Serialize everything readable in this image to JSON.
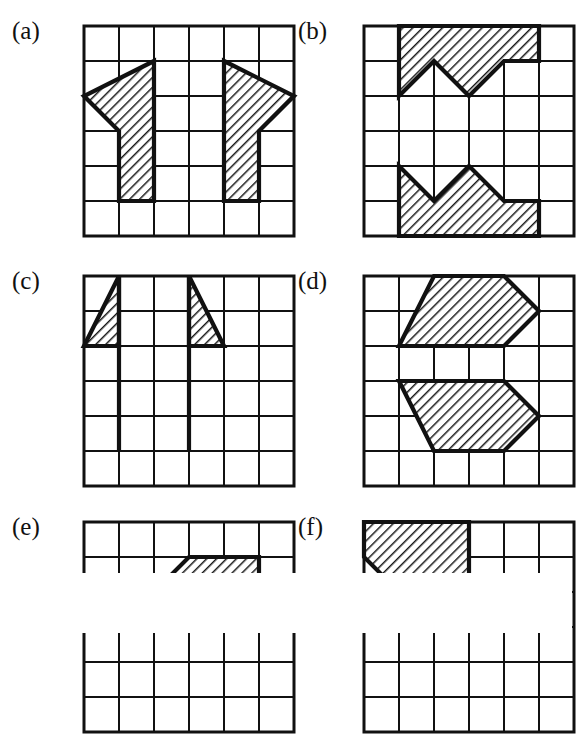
{
  "figure": {
    "kind": "grid-puzzle-figure",
    "panel_count": 6,
    "grid": {
      "cols": 6,
      "rows": 6,
      "cell_px": 35
    },
    "style": {
      "ink": "#111111",
      "paper": "#ffffff",
      "hatch_color": "#1a1a1a",
      "thin_line_px": 2,
      "thick_line_px": 4.2
    }
  },
  "panels": [
    {
      "id": "a",
      "label": "(a)",
      "label_x": 12,
      "label_y": 18,
      "grid_x": 80,
      "grid_y": 22,
      "shapes": [
        {
          "name": "left-arrow-up",
          "points": "2,1 0,2 1,3 1,5 2,5 2,3 2,1",
          "filled": true
        },
        {
          "name": "right-arrow-up",
          "points": "4,1 6,2 5,3 5,5 4,5 4,3 4,1",
          "filled": true
        }
      ]
    },
    {
      "id": "b",
      "label": "(b)",
      "label_x": 298,
      "label_y": 18,
      "grid_x": 360,
      "grid_y": 22,
      "shapes": [
        {
          "name": "top-zigzag-band",
          "points": "1,0 5,0 5,1 4,1 3,2 2,1 1,2 1,0",
          "filled": true
        },
        {
          "name": "bottom-zigzag-band",
          "points": "1,4 2,5 3,4 4,5 5,5 5,6 1,6 1,4",
          "filled": true
        }
      ]
    },
    {
      "id": "c",
      "label": "(c)",
      "label_x": 12,
      "label_y": 268,
      "grid_x": 80,
      "grid_y": 272,
      "shapes": [
        {
          "name": "left-triangle",
          "points": "1,0 1,2 0,2 1,0",
          "filled": true
        },
        {
          "name": "right-triangle",
          "points": "3,0 4,2 3,2 3,0",
          "filled": true
        }
      ],
      "lines": [
        {
          "name": "left-stem",
          "x1": 1,
          "y1": 0,
          "x2": 1,
          "y2": 5
        },
        {
          "name": "right-stem",
          "x1": 3,
          "y1": 0,
          "x2": 3,
          "y2": 5
        }
      ]
    },
    {
      "id": "d",
      "label": "(d)",
      "label_x": 298,
      "label_y": 268,
      "grid_x": 360,
      "grid_y": 272,
      "shapes": [
        {
          "name": "top-right-chevron",
          "points": "2,0 4,0 5,1 4,2 1,2 2,0",
          "filled": true
        },
        {
          "name": "bottom-right-chevron",
          "points": "1,3 4,3 5,4 4,5 2,5 1,3",
          "filled": true
        }
      ]
    },
    {
      "id": "e",
      "label": "(e)",
      "label_x": 12,
      "label_y": 514,
      "grid_x": 80,
      "grid_y": 518,
      "clipped": true,
      "shapes": [
        {
          "name": "partial-hatched-band",
          "points": "2,2 3,1 5,1 5,3 2,3 2,2",
          "filled": true
        }
      ]
    },
    {
      "id": "f",
      "label": "(f)",
      "label_x": 298,
      "label_y": 514,
      "grid_x": 360,
      "grid_y": 518,
      "clipped": true,
      "shapes": [
        {
          "name": "corner-triangle",
          "points": "0,0 3,0 3,2 1,2 0,1 0,0",
          "filled": true
        }
      ]
    }
  ]
}
